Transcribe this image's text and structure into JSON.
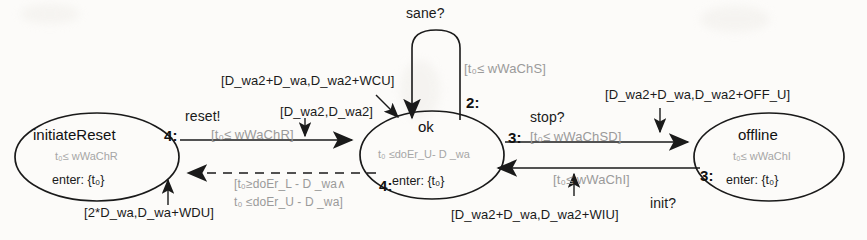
{
  "diagram": {
    "type": "state-machine",
    "background": "#fcfbf9",
    "stroke": "#1a1a1a",
    "faint_color": "#9a9a9a"
  },
  "states": [
    {
      "id": "initiateReset",
      "name": "initiateReset",
      "invariant": "t₀≤ wWaChR",
      "entry": "enter: {t₀}",
      "cx": 97,
      "cy": 157,
      "rx": 82,
      "ry": 44
    },
    {
      "id": "ok",
      "name": "ok",
      "invariant": "t₀ ≤doEr_U- D _wa",
      "entry": "enter: {t₀}",
      "cx": 432,
      "cy": 155,
      "rx": 72,
      "ry": 44
    },
    {
      "id": "offline",
      "name": "offline",
      "invariant": "t₀≤ wWaChI",
      "entry": "enter: {t₀}",
      "cx": 769,
      "cy": 157,
      "rx": 75,
      "ry": 44
    }
  ],
  "transitions": [
    {
      "id": "ok-self-sane",
      "event": "sane?",
      "guard": "[t₀≤ wWaChS]",
      "order": "2:",
      "from": "ok",
      "to": "ok",
      "style": "solid"
    },
    {
      "id": "initiateReset-to-ok",
      "event": "reset!",
      "guard": "[t₀≤ wWaChR]",
      "order": "4:",
      "delay_upper": "[D_wa2+D_wa,D_wa2+WCU]",
      "delay_lower": "[D_wa2,D_wa2]",
      "from": "initiateReset",
      "to": "ok",
      "style": "solid"
    },
    {
      "id": "ok-to-initiateReset",
      "guard_line1": "[t₀≥doEr_L - D _wa∧",
      "guard_line2": "t₀ ≤doEr_U - D _wa]",
      "order": "4:",
      "delay": "[2*D_wa,D_wa+WDU]",
      "from": "ok",
      "to": "initiateReset",
      "style": "dashed"
    },
    {
      "id": "ok-to-offline",
      "event": "stop?",
      "guard": "[t₀≤ wWaChSD]",
      "order": "3:",
      "delay": "[D_wa2+D_wa,D_wa2+OFF_U]",
      "from": "ok",
      "to": "offline",
      "style": "solid"
    },
    {
      "id": "offline-to-ok",
      "event": "init?",
      "guard": "[t₀≤ wWaChI]",
      "order": "3:",
      "delay": "[D_wa2+D_wa,D_wa2+WIU]",
      "from": "offline",
      "to": "ok",
      "style": "solid"
    }
  ]
}
